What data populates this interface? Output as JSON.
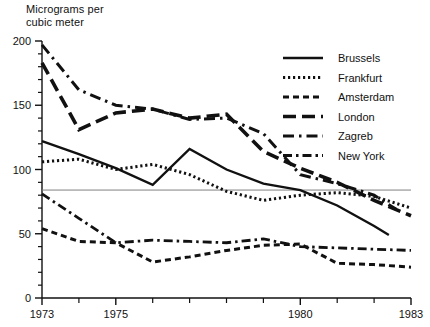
{
  "chart_data": {
    "type": "line",
    "title": "",
    "ylabel": "Micrograms per\ncubic meter",
    "xlabel": "",
    "xlim": [
      1973,
      1983
    ],
    "ylim": [
      0,
      200
    ],
    "ytick_labels": [
      "0",
      "50",
      "100",
      "150",
      "200"
    ],
    "ytick_values": [
      0,
      50,
      100,
      150,
      200
    ],
    "yminor_step": 10,
    "xtick_labels": [
      "1973",
      "1975",
      "1980",
      "1983"
    ],
    "xtick_values": [
      1973,
      1975,
      1980,
      1983
    ],
    "xminor_step": 1,
    "grid": false,
    "legend_position": "top-right",
    "reference_line": {
      "value": 84,
      "color": "#808080",
      "label": ""
    },
    "x": [
      1973,
      1974,
      1975,
      1976,
      1977,
      1978,
      1979,
      1980,
      1981,
      1982,
      1983
    ],
    "series": [
      {
        "name": "Brussels",
        "style": "solid",
        "values": [
          122,
          112,
          101,
          88,
          116,
          100,
          89,
          84,
          72,
          56,
          49
        ],
        "x_end": 1982.4
      },
      {
        "name": "Frankfurt",
        "style": "dotted",
        "values": [
          106,
          108,
          100,
          104,
          96,
          83,
          76,
          80,
          82,
          79,
          70
        ],
        "x_end": 1983
      },
      {
        "name": "Amsterdam",
        "style": "short-dash",
        "values": [
          54,
          44,
          43,
          28,
          32,
          37,
          41,
          42,
          27,
          26,
          24
        ],
        "x_end": 1983
      },
      {
        "name": "London",
        "style": "long-dash",
        "values": [
          183,
          131,
          144,
          147,
          140,
          143,
          114,
          101,
          90,
          76,
          64
        ],
        "x_end": 1983
      },
      {
        "name": "Zagreb",
        "style": "dash-dot",
        "values": [
          197,
          162,
          150,
          147,
          139,
          140,
          128,
          96,
          89,
          80,
          69
        ],
        "x_end": 1982.6
      },
      {
        "name": "New York",
        "style": "dash-dot-long",
        "values": [
          81,
          62,
          43,
          45,
          44,
          43,
          46,
          40,
          39,
          38,
          37
        ],
        "x_end": 1983
      }
    ]
  },
  "legend": {
    "entries": [
      {
        "label": "Brussels"
      },
      {
        "label": "Frankfurt"
      },
      {
        "label": "Amsterdam"
      },
      {
        "label": "London"
      },
      {
        "label": "Zagreb"
      },
      {
        "label": "New York"
      }
    ]
  }
}
